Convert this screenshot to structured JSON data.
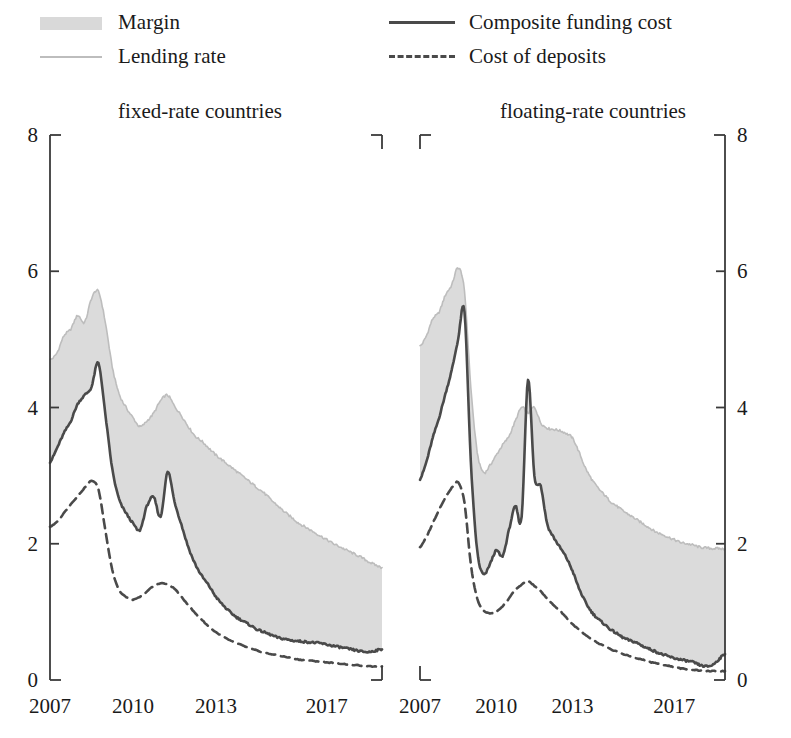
{
  "legend": {
    "items": [
      {
        "label": "Margin",
        "key": "margin-swatch"
      },
      {
        "label": "Lending rate",
        "key": "light-solid-line"
      },
      {
        "label": "Composite funding cost",
        "key": "dark-solid-line"
      },
      {
        "label": "Cost of deposits",
        "key": "dark-dashed-line"
      }
    ]
  },
  "colors": {
    "margin_fill": "#d9d9d9",
    "lending_line": "#bdbdbd",
    "composite_line": "#4a4a4a",
    "deposits_line": "#4a4a4a",
    "axis": "#3a3a3a",
    "text": "#1a1a1a",
    "background": "#ffffff"
  },
  "chart_data": [
    {
      "type": "area",
      "panel": "left",
      "title": "fixed-rate countries",
      "xlabel": "",
      "ylabel": "",
      "ylim": [
        0,
        8
      ],
      "yticks": [
        0,
        2,
        4,
        6,
        8
      ],
      "xlim": [
        2007.0,
        2019.0
      ],
      "xticks": [
        2007,
        2010,
        2013,
        2017
      ],
      "xticklabels": [
        "2007",
        "2010",
        "2013",
        "2017"
      ],
      "grid": false,
      "axis_side": "left",
      "legend_position": "top",
      "x": [
        2007.0,
        2007.25,
        2007.5,
        2007.75,
        2008.0,
        2008.25,
        2008.5,
        2008.75,
        2009.0,
        2009.25,
        2009.5,
        2009.75,
        2010.0,
        2010.25,
        2010.5,
        2010.75,
        2011.0,
        2011.25,
        2011.5,
        2011.75,
        2012.0,
        2012.25,
        2012.5,
        2012.75,
        2013.0,
        2013.25,
        2013.5,
        2013.75,
        2014.0,
        2014.25,
        2014.5,
        2014.75,
        2015.0,
        2015.25,
        2015.5,
        2015.75,
        2016.0,
        2016.25,
        2016.5,
        2016.75,
        2017.0,
        2017.25,
        2017.5,
        2017.75,
        2018.0,
        2018.25,
        2018.5,
        2018.75,
        2019.0
      ],
      "series": [
        {
          "name": "Lending rate",
          "values": [
            4.7,
            4.8,
            5.05,
            5.15,
            5.35,
            5.25,
            5.6,
            5.7,
            5.25,
            4.6,
            4.2,
            4.0,
            3.85,
            3.72,
            3.8,
            3.92,
            4.1,
            4.18,
            4.02,
            3.88,
            3.72,
            3.58,
            3.5,
            3.4,
            3.3,
            3.22,
            3.14,
            3.06,
            2.98,
            2.9,
            2.82,
            2.74,
            2.64,
            2.55,
            2.46,
            2.38,
            2.3,
            2.24,
            2.18,
            2.12,
            2.06,
            2.0,
            1.95,
            1.9,
            1.85,
            1.8,
            1.74,
            1.69,
            1.65
          ]
        },
        {
          "name": "Composite funding cost",
          "values": [
            3.2,
            3.4,
            3.62,
            3.8,
            4.05,
            4.18,
            4.3,
            4.65,
            3.9,
            3.1,
            2.65,
            2.45,
            2.3,
            2.2,
            2.55,
            2.68,
            2.4,
            3.05,
            2.62,
            2.28,
            1.95,
            1.7,
            1.52,
            1.38,
            1.22,
            1.1,
            1.0,
            0.92,
            0.86,
            0.8,
            0.74,
            0.7,
            0.66,
            0.62,
            0.6,
            0.58,
            0.57,
            0.56,
            0.55,
            0.54,
            0.52,
            0.5,
            0.48,
            0.46,
            0.44,
            0.42,
            0.41,
            0.43,
            0.45
          ]
        },
        {
          "name": "Cost of deposits",
          "values": [
            2.25,
            2.32,
            2.45,
            2.58,
            2.7,
            2.82,
            2.92,
            2.8,
            2.2,
            1.62,
            1.32,
            1.22,
            1.18,
            1.22,
            1.3,
            1.38,
            1.42,
            1.4,
            1.34,
            1.22,
            1.1,
            0.98,
            0.88,
            0.78,
            0.7,
            0.64,
            0.58,
            0.54,
            0.5,
            0.46,
            0.43,
            0.4,
            0.38,
            0.36,
            0.34,
            0.32,
            0.3,
            0.29,
            0.28,
            0.27,
            0.26,
            0.25,
            0.24,
            0.23,
            0.22,
            0.21,
            0.2,
            0.2,
            0.2
          ]
        }
      ],
      "margin_band": {
        "upper": "Lending rate",
        "lower": "Composite funding cost"
      }
    },
    {
      "type": "area",
      "panel": "right",
      "title": "floating-rate countries",
      "xlabel": "",
      "ylabel": "",
      "ylim": [
        0,
        8
      ],
      "yticks": [
        0,
        2,
        4,
        6,
        8
      ],
      "xlim": [
        2007.0,
        2019.0
      ],
      "xticks": [
        2007,
        2010,
        2013,
        2017
      ],
      "xticklabels": [
        "2007",
        "2010",
        "2013",
        "2017"
      ],
      "grid": false,
      "axis_side": "right",
      "legend_position": "top",
      "x": [
        2007.0,
        2007.25,
        2007.5,
        2007.75,
        2008.0,
        2008.25,
        2008.5,
        2008.75,
        2009.0,
        2009.25,
        2009.5,
        2009.75,
        2010.0,
        2010.25,
        2010.5,
        2010.75,
        2011.0,
        2011.25,
        2011.5,
        2011.75,
        2012.0,
        2012.25,
        2012.5,
        2012.75,
        2013.0,
        2013.25,
        2013.5,
        2013.75,
        2014.0,
        2014.25,
        2014.5,
        2014.75,
        2015.0,
        2015.25,
        2015.5,
        2015.75,
        2016.0,
        2016.25,
        2016.5,
        2016.75,
        2017.0,
        2017.25,
        2017.5,
        2017.75,
        2018.0,
        2018.25,
        2018.5,
        2018.75,
        2019.0
      ],
      "series": [
        {
          "name": "Lending rate",
          "values": [
            4.9,
            5.05,
            5.3,
            5.4,
            5.65,
            5.8,
            6.05,
            5.7,
            4.3,
            3.35,
            3.05,
            3.15,
            3.3,
            3.45,
            3.58,
            3.8,
            4.0,
            3.92,
            4.0,
            3.78,
            3.7,
            3.68,
            3.66,
            3.62,
            3.55,
            3.35,
            3.12,
            2.95,
            2.82,
            2.72,
            2.62,
            2.55,
            2.48,
            2.42,
            2.36,
            2.3,
            2.24,
            2.18,
            2.14,
            2.1,
            2.06,
            2.02,
            2.0,
            1.98,
            1.95,
            1.94,
            1.93,
            1.93,
            1.92
          ]
        },
        {
          "name": "Composite funding cost",
          "values": [
            2.95,
            3.2,
            3.55,
            3.85,
            4.2,
            4.55,
            5.0,
            5.4,
            3.2,
            1.9,
            1.55,
            1.7,
            1.9,
            1.82,
            2.2,
            2.55,
            2.4,
            4.4,
            3.0,
            2.85,
            2.3,
            2.1,
            1.95,
            1.8,
            1.6,
            1.35,
            1.15,
            1.0,
            0.9,
            0.82,
            0.74,
            0.68,
            0.62,
            0.58,
            0.55,
            0.5,
            0.46,
            0.42,
            0.38,
            0.35,
            0.32,
            0.3,
            0.28,
            0.26,
            0.22,
            0.2,
            0.22,
            0.3,
            0.38
          ]
        },
        {
          "name": "Cost of deposits",
          "values": [
            1.95,
            2.1,
            2.3,
            2.5,
            2.68,
            2.82,
            2.9,
            2.6,
            1.7,
            1.2,
            1.02,
            0.98,
            1.0,
            1.08,
            1.2,
            1.32,
            1.4,
            1.45,
            1.38,
            1.3,
            1.2,
            1.1,
            1.02,
            0.92,
            0.82,
            0.74,
            0.66,
            0.6,
            0.54,
            0.5,
            0.45,
            0.42,
            0.38,
            0.35,
            0.32,
            0.3,
            0.27,
            0.25,
            0.23,
            0.21,
            0.19,
            0.17,
            0.16,
            0.15,
            0.14,
            0.13,
            0.13,
            0.13,
            0.13
          ]
        }
      ],
      "margin_band": {
        "upper": "Lending rate",
        "lower": "Composite funding cost"
      }
    }
  ]
}
